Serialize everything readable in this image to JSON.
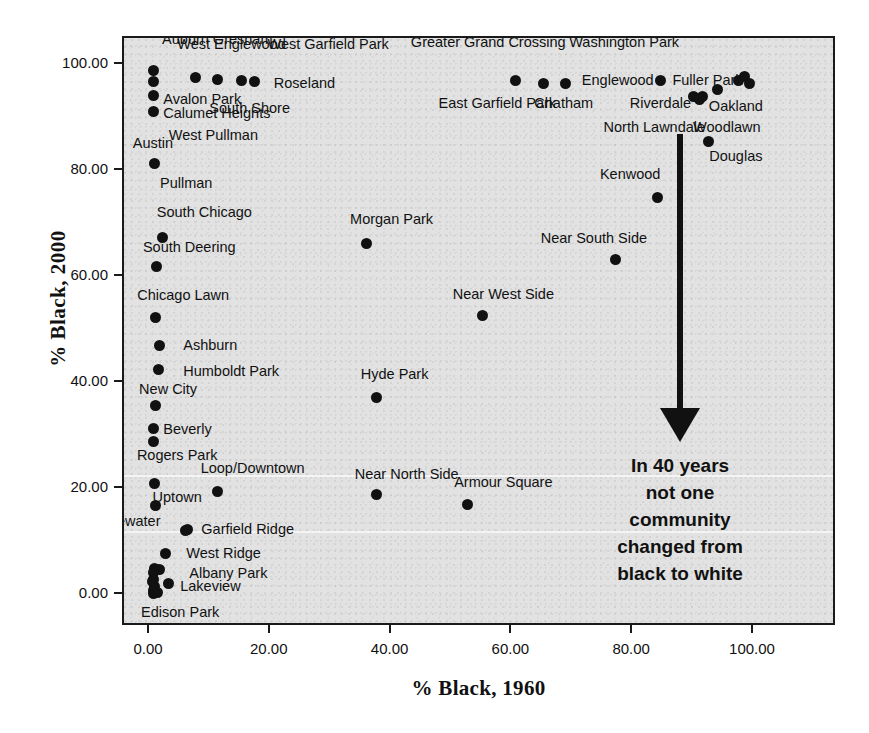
{
  "chart_data": {
    "type": "scatter",
    "title": "",
    "xlabel": "% Black, 1960",
    "ylabel": "% Black, 2000",
    "xlim": [
      -5,
      107
    ],
    "ylim": [
      -5,
      107
    ],
    "xticks": [
      "0.00",
      "20.00",
      "40.00",
      "60.00",
      "80.00",
      "100.00"
    ],
    "xtick_values": [
      0,
      20,
      40,
      60,
      80,
      100
    ],
    "yticks": [
      "0.00",
      "20.00",
      "40.00",
      "60.00",
      "80.00",
      "100.00"
    ],
    "ytick_values": [
      0,
      20,
      40,
      60,
      80,
      100
    ],
    "grid": false,
    "legend": null,
    "marker_color": "#111111",
    "plot_background": "#e2e2e2",
    "annotation": "In 40 years\nnot one\ncommunity\nchanged from\nblack to white",
    "points": [
      {
        "label": "Auburn Gresham",
        "x": 0.6,
        "y": 98.9,
        "lx": 2,
        "ly": 104.5,
        "anchor": "left"
      },
      {
        "label": "West Englewood",
        "x": 7.6,
        "y": 97.6,
        "lx": 13.5,
        "ly": 103.5,
        "anchor": "center"
      },
      {
        "label": "West Garfield Park",
        "x": 11.2,
        "y": 97.3,
        "lx": 29.5,
        "ly": 103.5,
        "anchor": "center"
      },
      {
        "label": "Roseland",
        "x": 17.3,
        "y": 96.8,
        "lx": 20.5,
        "ly": 96.2,
        "anchor": "left"
      },
      {
        "label": "South Shore",
        "x": 15.2,
        "y": 97.0,
        "lx": 16.5,
        "ly": 91.5,
        "anchor": "center"
      },
      {
        "label": "Avalon Park",
        "x": 0.6,
        "y": 94.2,
        "lx": 2.2,
        "ly": 93.3,
        "anchor": "left"
      },
      {
        "label": "Calumet Heights",
        "x": 0.6,
        "y": 91.3,
        "lx": 2.2,
        "ly": 90.5,
        "anchor": "left"
      },
      {
        "label": "Austin",
        "x": null,
        "y": null,
        "lx": 0.5,
        "ly": 85.0,
        "anchor": "center"
      },
      {
        "label": "West Pullman",
        "x": null,
        "y": null,
        "lx": 10.5,
        "ly": 86.5,
        "anchor": "center"
      },
      {
        "label": "Pullman",
        "x": 0.7,
        "y": 81.5,
        "lx": 6.0,
        "ly": 77.3,
        "anchor": "center"
      },
      {
        "label": "South Chicago",
        "x": 2.1,
        "y": 67.5,
        "lx": 9.0,
        "ly": 71.8,
        "anchor": "center"
      },
      {
        "label": "South Deering",
        "x": 1.0,
        "y": 62.0,
        "lx": 6.5,
        "ly": 65.2,
        "anchor": "center"
      },
      {
        "label": "Chicago Lawn",
        "x": 0.9,
        "y": 52.3,
        "lx": 5.5,
        "ly": 56.3,
        "anchor": "center"
      },
      {
        "label": "Ashburn",
        "x": 1.5,
        "y": 47.0,
        "lx": 5.5,
        "ly": 46.8,
        "anchor": "left"
      },
      {
        "label": "Humboldt Park",
        "x": 1.4,
        "y": 42.5,
        "lx": 5.5,
        "ly": 41.8,
        "anchor": "left"
      },
      {
        "label": "New City",
        "x": 0.9,
        "y": 35.8,
        "lx": 3.0,
        "ly": 38.5,
        "anchor": "center"
      },
      {
        "label": "Beverly",
        "x": 0.5,
        "y": 31.5,
        "lx": 2.2,
        "ly": 31.0,
        "anchor": "left"
      },
      {
        "label": "Rogers Park",
        "x": 0.5,
        "y": 29.0,
        "lx": 4.5,
        "ly": 26.0,
        "anchor": "center"
      },
      {
        "label": "Loop/Downtown",
        "x": 11.2,
        "y": 19.5,
        "lx": 17.0,
        "ly": 23.5,
        "anchor": "center"
      },
      {
        "label": "Uptown",
        "x": 0.8,
        "y": 21.0,
        "lx": 4.5,
        "ly": 18.2,
        "anchor": "center"
      },
      {
        "label": "Edgewater",
        "x": 0.9,
        "y": 16.8,
        "lx": -4.0,
        "ly": 13.5,
        "anchor": "center"
      },
      {
        "label": "Garfield Ridge",
        "x": 6.2,
        "y": 12.3,
        "lx": 8.5,
        "ly": 12.0,
        "anchor": "left"
      },
      {
        "label": "West Ridge",
        "x": 2.6,
        "y": 7.8,
        "lx": 6.0,
        "ly": 7.5,
        "anchor": "left"
      },
      {
        "label": "Albany Park",
        "x": 0.8,
        "y": 5.0,
        "lx": 6.5,
        "ly": 3.8,
        "anchor": "left"
      },
      {
        "label": "Lakeview",
        "x": 3.0,
        "y": 2.2,
        "lx": 5.0,
        "ly": 1.3,
        "anchor": "left"
      },
      {
        "label": "Edison Park",
        "x": 0.5,
        "y": 0.3,
        "lx": 5.0,
        "ly": -3.5,
        "anchor": "center"
      },
      {
        "label": "Morgan Park",
        "x": 35.8,
        "y": 66.3,
        "lx": 40.0,
        "ly": 70.5,
        "anchor": "center"
      },
      {
        "label": "Near West Side",
        "x": 55.0,
        "y": 52.8,
        "lx": 58.5,
        "ly": 56.5,
        "anchor": "center"
      },
      {
        "label": "Hyde Park",
        "x": 37.5,
        "y": 37.3,
        "lx": 40.5,
        "ly": 41.3,
        "anchor": "center"
      },
      {
        "label": "Near North Side",
        "x": 37.5,
        "y": 19.0,
        "lx": 42.5,
        "ly": 22.5,
        "anchor": "center"
      },
      {
        "label": "Armour Square",
        "x": 52.5,
        "y": 17.0,
        "lx": 58.5,
        "ly": 21.0,
        "anchor": "center"
      },
      {
        "label": "Greater Grand Crossing",
        "x": 60.5,
        "y": 97.0,
        "lx": 56.0,
        "ly": 104.0,
        "anchor": "center"
      },
      {
        "label": "East Garfield Park",
        "x": 65.2,
        "y": 96.5,
        "lx": 57.5,
        "ly": 92.5,
        "anchor": "center"
      },
      {
        "label": "Washington Park",
        "x": 68.8,
        "y": 96.5,
        "lx": 78.5,
        "ly": 104.0,
        "anchor": "center"
      },
      {
        "label": "Chatham",
        "x": null,
        "y": null,
        "lx": 68.5,
        "ly": 92.5,
        "anchor": "center"
      },
      {
        "label": "Englewood",
        "x": null,
        "y": null,
        "lx": 71.5,
        "ly": 96.8,
        "anchor": "left"
      },
      {
        "label": "Fuller Park",
        "x": 84.5,
        "y": 97.0,
        "lx": 86.5,
        "ly": 96.7,
        "anchor": "left"
      },
      {
        "label": "Grand Boulevard",
        "x": 97.5,
        "y": 97.0,
        "lx": 96.0,
        "ly": 107.5,
        "anchor": "center"
      },
      {
        "label": "Riverdale",
        "x": 90.0,
        "y": 94.0,
        "lx": 84.5,
        "ly": 92.5,
        "anchor": "center"
      },
      {
        "label": "Oakland",
        "x": 94.0,
        "y": 95.3,
        "lx": 97.0,
        "ly": 91.8,
        "anchor": "center"
      },
      {
        "label": "North Lawndale",
        "x": 91.5,
        "y": 94.0,
        "lx": 83.5,
        "ly": 88.0,
        "anchor": "center"
      },
      {
        "label": "Woodlawn",
        "x": null,
        "y": null,
        "lx": 95.5,
        "ly": 88.0,
        "anchor": "center"
      },
      {
        "label": "Douglas",
        "x": 92.5,
        "y": 85.5,
        "lx": 97.0,
        "ly": 82.5,
        "anchor": "center"
      },
      {
        "label": "Kenwood",
        "x": 84.0,
        "y": 75.0,
        "lx": 79.5,
        "ly": 79.0,
        "anchor": "center"
      },
      {
        "label": "Near South Side",
        "x": 77.0,
        "y": 63.3,
        "lx": 73.5,
        "ly": 67.0,
        "anchor": "center"
      }
    ],
    "extra_points": [
      {
        "x": 0.6,
        "y": 96.8
      },
      {
        "x": 99.2,
        "y": 96.5
      },
      {
        "x": 98.4,
        "y": 97.8
      },
      {
        "x": 91.0,
        "y": 93.5
      },
      {
        "x": 0.5,
        "y": 4.2
      },
      {
        "x": 1.6,
        "y": 4.8
      },
      {
        "x": 0.6,
        "y": 3.0
      },
      {
        "x": 0.8,
        "y": 1.6
      },
      {
        "x": 0.5,
        "y": 0.9
      },
      {
        "x": 1.2,
        "y": 0.4
      },
      {
        "x": 0.4,
        "y": 2.6
      },
      {
        "x": 5.8,
        "y": 12.1
      }
    ]
  }
}
